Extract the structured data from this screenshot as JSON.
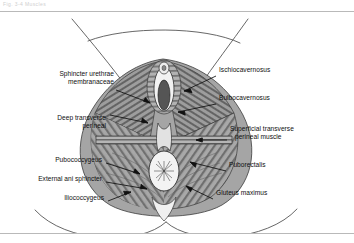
{
  "page": {
    "header_note": "Fig. 3-4 Muscles",
    "background_color": "#ffffff",
    "rule_color": "#b9b9b9"
  },
  "figure": {
    "ink_color": "#2b2b2b",
    "muscle_fill": "#9a9a9a",
    "muscle_dark": "#6e6e6e",
    "muscle_light": "#c9c9c9",
    "view": "inferior view of female perineum with thighs abducted"
  },
  "labels_left": [
    {
      "id": "sphincter-urethrae",
      "lines": [
        "Sphincter urethrae",
        "membranaceae"
      ],
      "x": 22,
      "y": 70
    },
    {
      "id": "deep-transverse-perineal",
      "lines": [
        "Deep transverse",
        "perineal"
      ],
      "x": 14,
      "y": 114
    },
    {
      "id": "pubococcygeus",
      "lines": [
        "Pubococcygeus"
      ],
      "x": 26,
      "y": 156
    },
    {
      "id": "external-ani-sphincter",
      "lines": [
        "External ani sphincter"
      ],
      "x": 4,
      "y": 175
    },
    {
      "id": "iliococcygeus",
      "lines": [
        "Iliococcygeus"
      ],
      "x": 52,
      "y": 194
    }
  ],
  "labels_right": [
    {
      "id": "ischiocavernosus",
      "lines": [
        "Ischiocavernosus"
      ],
      "x": 219,
      "y": 68
    },
    {
      "id": "bulbocavernosus",
      "lines": [
        "Bulbocavernosus"
      ],
      "x": 219,
      "y": 96
    },
    {
      "id": "superficial-transverse-perineal-muscle",
      "lines": [
        "Superficial transverse",
        "perineal muscle"
      ],
      "x": 230,
      "y": 126
    },
    {
      "id": "puborectalis",
      "lines": [
        "Puborectalis"
      ],
      "x": 229,
      "y": 163
    },
    {
      "id": "gluteus-maximus",
      "lines": [
        "Gluteus maximus"
      ],
      "x": 216,
      "y": 191
    }
  ]
}
